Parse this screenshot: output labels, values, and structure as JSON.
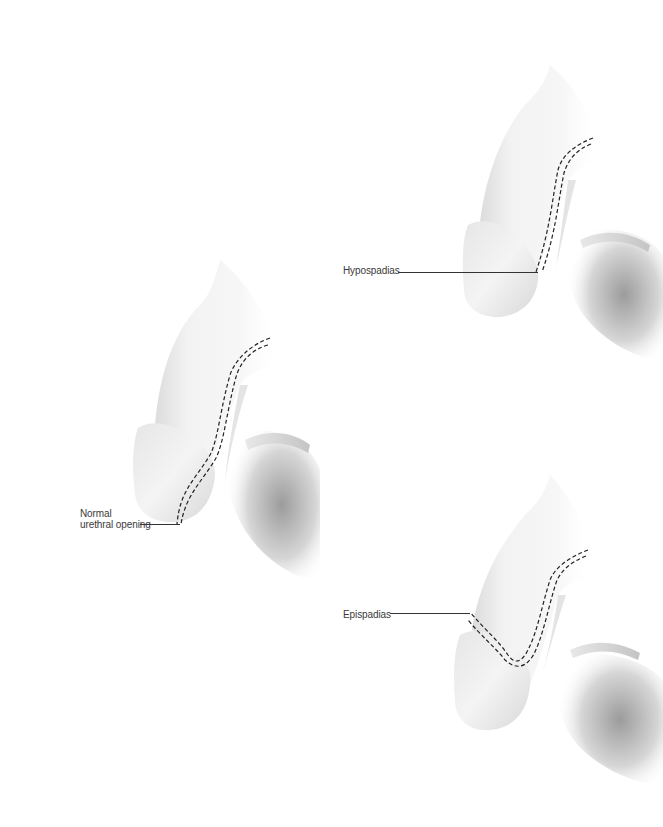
{
  "diagram": {
    "type": "anatomical-comparison",
    "background": "#ffffff",
    "line_color": "#333333",
    "panels": [
      {
        "id": "normal",
        "label_line1": "Normal",
        "label_line2": "urethral opening",
        "position": "left-middle"
      },
      {
        "id": "hypospadias",
        "label": "Hypospadias",
        "position": "top-right"
      },
      {
        "id": "epispadias",
        "label": "Epispadias",
        "position": "bottom-right"
      }
    ]
  }
}
